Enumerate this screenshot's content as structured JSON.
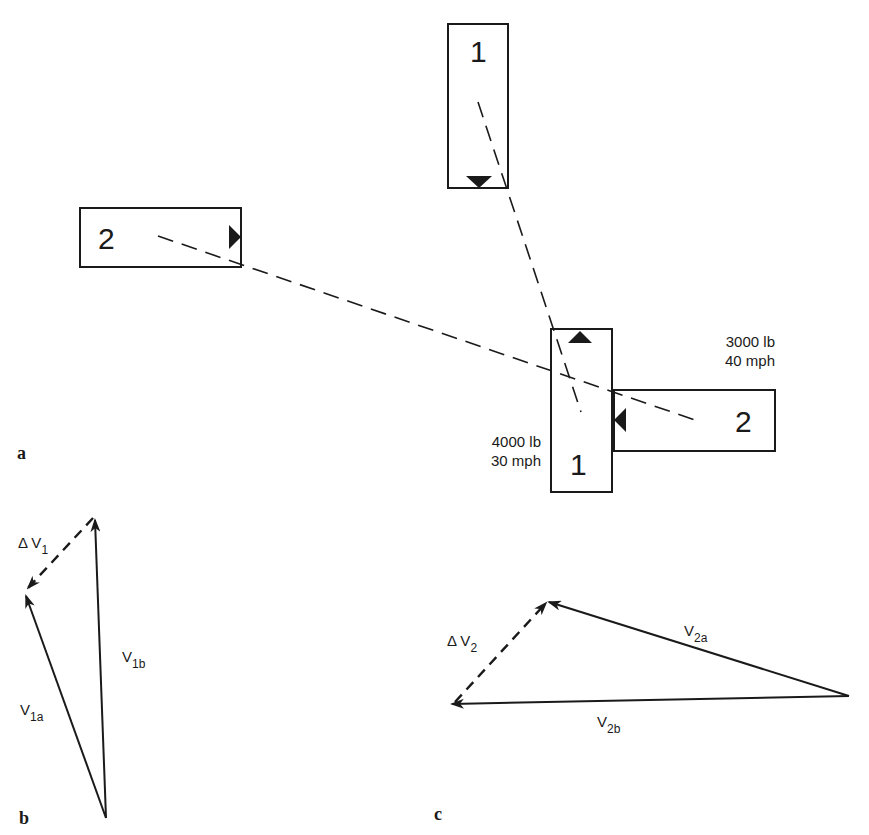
{
  "panel_a": {
    "label": "a",
    "vehicle1": {
      "number": "1",
      "weight": "4000 lb",
      "speed": "30 mph"
    },
    "vehicle2": {
      "number": "2",
      "weight": "3000 lb",
      "speed": "40 mph"
    },
    "precrash_vehicle1_label": "1",
    "precrash_vehicle2_label": "2",
    "postcrash_vehicle1_label": "1",
    "postcrash_vehicle2_label": "2"
  },
  "panel_b": {
    "label": "b",
    "delta_v": {
      "base": "Δ V",
      "sub": "1"
    },
    "v_a": {
      "base": "V",
      "sub": "1a"
    },
    "v_b": {
      "base": "V",
      "sub": "1b"
    }
  },
  "panel_c": {
    "label": "c",
    "delta_v": {
      "base": "Δ V",
      "sub": "2"
    },
    "v_a": {
      "base": "V",
      "sub": "2a"
    },
    "v_b": {
      "base": "V",
      "sub": "2b"
    }
  },
  "colors": {
    "ink": "#1a1a1a",
    "background": "#ffffff"
  }
}
